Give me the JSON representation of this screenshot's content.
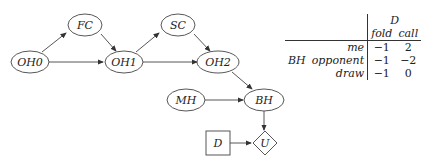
{
  "diagram": {
    "nodes": [
      {
        "id": "OH0",
        "label": "OH0",
        "shape": "ellipse",
        "cx": 30,
        "cy": 62
      },
      {
        "id": "FC",
        "label": "FC",
        "shape": "ellipse",
        "cx": 85,
        "cy": 25
      },
      {
        "id": "OH1",
        "label": "OH1",
        "shape": "ellipse",
        "cx": 124,
        "cy": 62
      },
      {
        "id": "SC",
        "label": "SC",
        "shape": "ellipse",
        "cx": 178,
        "cy": 25
      },
      {
        "id": "OH2",
        "label": "OH2",
        "shape": "ellipse",
        "cx": 218,
        "cy": 62
      },
      {
        "id": "MH",
        "label": "MH",
        "shape": "ellipse",
        "cx": 186,
        "cy": 100
      },
      {
        "id": "BH",
        "label": "BH",
        "shape": "ellipse",
        "cx": 264,
        "cy": 100
      },
      {
        "id": "D",
        "label": "D",
        "shape": "rect",
        "cx": 218,
        "cy": 143
      },
      {
        "id": "U",
        "label": "U",
        "shape": "diamond",
        "cx": 265,
        "cy": 143
      }
    ],
    "edges": [
      [
        "OH0",
        "FC"
      ],
      [
        "FC",
        "OH1"
      ],
      [
        "OH0",
        "OH1"
      ],
      [
        "OH1",
        "SC"
      ],
      [
        "SC",
        "OH2"
      ],
      [
        "OH1",
        "OH2"
      ],
      [
        "OH2",
        "BH"
      ],
      [
        "MH",
        "BH"
      ],
      [
        "BH",
        "U"
      ],
      [
        "D",
        "U"
      ]
    ]
  },
  "table": {
    "column_group": "D",
    "columns": [
      "fold",
      "call"
    ],
    "row_group": "BH",
    "rows": [
      {
        "label": "me",
        "values": [
          "−1",
          "2"
        ]
      },
      {
        "label": "opponent",
        "values": [
          "−1",
          "−2"
        ]
      },
      {
        "label": "draw",
        "values": [
          "−1",
          "0"
        ]
      }
    ]
  }
}
